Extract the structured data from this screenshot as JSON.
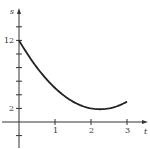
{
  "chart_data": {
    "type": "line",
    "title": "",
    "xlabel": "t",
    "ylabel": "s",
    "x_ticks": [
      1,
      2,
      3
    ],
    "x_tick_labels": [
      "1",
      "2",
      "3"
    ],
    "y_ticks": [
      2,
      4,
      6,
      8,
      10,
      12,
      14,
      16
    ],
    "y_tick_labels_shown": {
      "2": "2",
      "12": "12"
    },
    "xlim": [
      -0.5,
      3.5
    ],
    "ylim": [
      -3.5,
      17.5
    ],
    "grid": false,
    "legend": null,
    "series": [
      {
        "name": "s(t)",
        "x": [
          0,
          0.5,
          1,
          1.5,
          2,
          2.25,
          2.5,
          3
        ],
        "values": [
          12,
          8,
          5,
          3,
          2,
          1.9,
          2,
          3
        ]
      }
    ]
  },
  "labels": {
    "x_axis": "t",
    "y_axis": "s",
    "x1": "1",
    "x2": "2",
    "x3": "3",
    "y2": "2",
    "y12": "12"
  },
  "colors": {
    "axis": "#333333",
    "curve": "#222222"
  }
}
